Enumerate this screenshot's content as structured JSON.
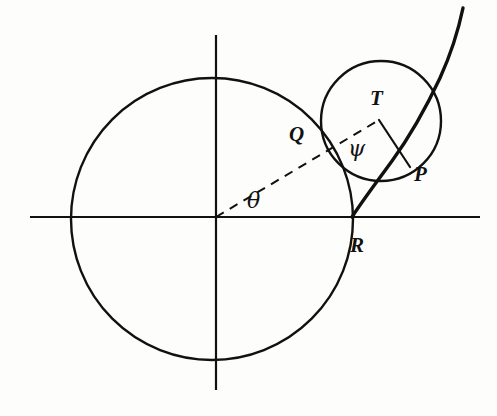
{
  "figure": {
    "background_color": "#fdfdfc",
    "stroke_color": "#111111",
    "width": 497,
    "height": 416
  },
  "axes": {
    "origin": {
      "x": 216,
      "y": 217
    },
    "x_axis": {
      "x1": 30,
      "y1": 217,
      "x2": 480,
      "y2": 217,
      "stroke_width": 2.2
    },
    "y_axis": {
      "x1": 216,
      "y1": 35,
      "x2": 216,
      "y2": 390,
      "stroke_width": 2.2
    }
  },
  "shapes": {
    "base_circle": {
      "name": "large-circle",
      "cx": 212,
      "cy": 219,
      "r": 141,
      "stroke_width": 2.4,
      "fill": "none"
    },
    "rolling_circle": {
      "name": "small-rolling-circle",
      "cx": 381,
      "cy": 121,
      "r": 60,
      "stroke_width": 2.4,
      "fill": "none"
    },
    "curve": {
      "name": "cycloid-curve",
      "stroke_width": 3.4,
      "path": "M 352,217 C 363,200 376,183 392,161 C 408,139 424,112 440,78 C 450,56 458,32 463,8"
    },
    "radius_line_TP": {
      "name": "radius-T-to-P",
      "x1": 379,
      "y1": 120,
      "x2": 410,
      "y2": 167,
      "stroke_width": 2.2
    },
    "dashed_line_OT": {
      "name": "dashed-ray-origin-to-T",
      "x1": 216,
      "y1": 217,
      "x2": 379,
      "y2": 120,
      "stroke_width": 2.0,
      "dash": "9 7"
    }
  },
  "labels": {
    "point_T": "T",
    "point_Q": "Q",
    "point_P": "P",
    "point_R": "R",
    "angle_theta": "θ",
    "angle_psi": "ψ"
  }
}
